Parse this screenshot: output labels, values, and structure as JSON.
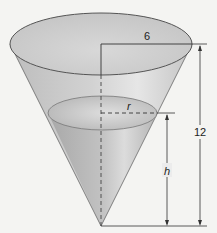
{
  "diagram": {
    "type": "cone-water-tank",
    "labels": {
      "top_radius": "6",
      "water_radius": "r",
      "water_height": "h",
      "total_height": "12"
    },
    "colors": {
      "background": "#f4f4f2",
      "cone_fill": "#c9c9c9",
      "water_fill": "#b2b2b2",
      "outline": "#555555",
      "dim_line": "#333333"
    }
  }
}
